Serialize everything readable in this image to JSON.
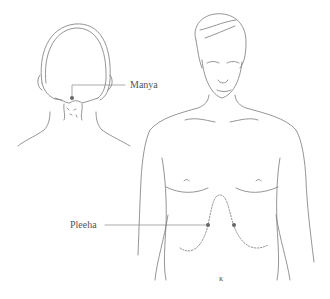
{
  "diagram": {
    "figures": [
      {
        "name": "back-of-head",
        "view": "posterior head and neck"
      },
      {
        "name": "front-torso",
        "view": "anterior head and torso"
      }
    ],
    "points": [
      {
        "label": "Manya",
        "x": 72,
        "y": 98
      },
      {
        "label": "Pleeha",
        "x": 208,
        "y": 225
      }
    ],
    "extra_marker": {
      "x": 234,
      "y": 225
    },
    "small_mark": "ĸ",
    "colors": {
      "line": "#777777",
      "point": "#666666",
      "text": "#555555"
    }
  }
}
